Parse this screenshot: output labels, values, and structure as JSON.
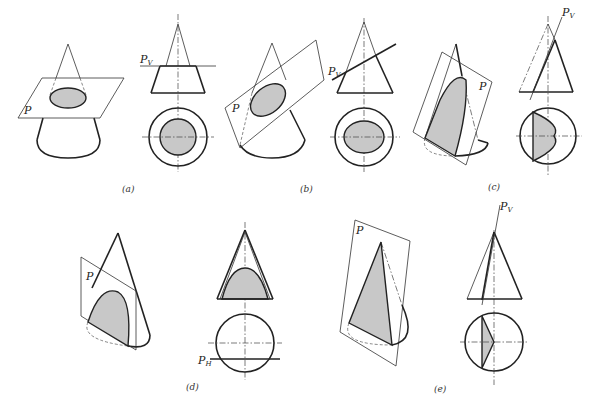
{
  "figure": {
    "panels": [
      {
        "id": "a",
        "caption": "(a)",
        "plane_label": "P",
        "trace_label": "Pv",
        "section": "circle",
        "description": "Plane perpendicular to axis — section is a circle"
      },
      {
        "id": "b",
        "caption": "(b)",
        "plane_label": "P",
        "trace_label": "Pv",
        "section": "ellipse",
        "description": "Plane inclined, cutting all generators — section is an ellipse"
      },
      {
        "id": "c",
        "caption": "(c)",
        "plane_label": "P",
        "trace_label": "Pv",
        "section": "parabola",
        "description": "Plane parallel to one generator — section is a parabola"
      },
      {
        "id": "d",
        "caption": "(d)",
        "plane_label": "P",
        "trace_label": "PH",
        "section": "hyperbola",
        "description": "Plane parallel to axis — section is a hyperbola"
      },
      {
        "id": "e",
        "caption": "(e)",
        "plane_label": "P",
        "trace_label": "Pv",
        "section": "triangle",
        "description": "Plane through apex — section is a triangle"
      }
    ]
  },
  "labels": {
    "P": "P",
    "Pv_main": "P",
    "Pv_sub": "V",
    "PH_main": "P",
    "PH_sub": "H"
  },
  "captions": {
    "a": "(a)",
    "b": "(b)",
    "c": "(c)",
    "d": "(d)",
    "e": "(e)"
  },
  "colors": {
    "section_fill": "#c8c8c8",
    "line": "#222222"
  }
}
